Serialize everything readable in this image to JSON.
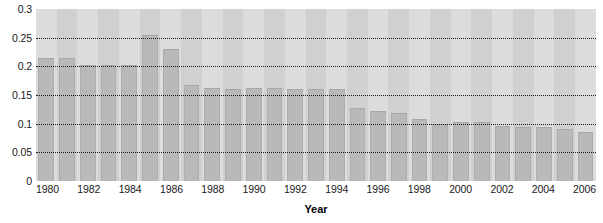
{
  "chart_data": {
    "type": "bar",
    "title": "",
    "xlabel": "Year",
    "ylabel": "",
    "ylim": [
      0,
      0.3
    ],
    "ytick_values": [
      0,
      0.05,
      0.1,
      0.15,
      0.2,
      0.25,
      0.3
    ],
    "ytick_labels": [
      "0",
      "0.05",
      "0.1",
      "0.15",
      "0.2",
      "0.25",
      "0.3"
    ],
    "grid": true,
    "grid_style": "dotted",
    "legend": "none",
    "categories": [
      "1980",
      "1981",
      "1982",
      "1983",
      "1984",
      "1985",
      "1986",
      "1987",
      "1988",
      "1989",
      "1990",
      "1991",
      "1992",
      "1993",
      "1994",
      "1995",
      "1996",
      "1997",
      "1998",
      "1999",
      "2000",
      "2001",
      "2002",
      "2003",
      "2004",
      "2005",
      "2006"
    ],
    "xtick_labels": [
      "1980",
      "",
      "1982",
      "",
      "1984",
      "",
      "1986",
      "",
      "1988",
      "",
      "1990",
      "",
      "1992",
      "",
      "1994",
      "",
      "1996",
      "",
      "1998",
      "",
      "2000",
      "",
      "2002",
      "",
      "2004",
      "",
      "2006"
    ],
    "values": [
      0.215,
      0.215,
      0.202,
      0.202,
      0.202,
      0.255,
      0.231,
      0.168,
      0.163,
      0.16,
      0.163,
      0.163,
      0.16,
      0.16,
      0.16,
      0.128,
      0.122,
      0.119,
      0.108,
      0.1,
      0.103,
      0.103,
      0.096,
      0.094,
      0.094,
      0.091,
      0.085
    ],
    "colors": {
      "bar_fill": "#b9b9b9",
      "bar_edge": "#a8a8a8",
      "plot_background": "#d2d2d2",
      "band_light": "#dcdcdc",
      "band_dark": "#d0d0d0",
      "gridline": "#1a1a1a",
      "text": "#1a1a1a",
      "page_background": "#ffffff"
    }
  }
}
